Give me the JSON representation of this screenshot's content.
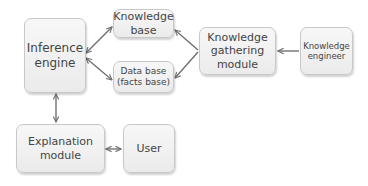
{
  "diagram": {
    "nodes": [
      {
        "id": "inference_engine",
        "label": "Inference\nengine"
      },
      {
        "id": "knowledge_base",
        "label": "Knowledge\nbase"
      },
      {
        "id": "data_base",
        "label": "Data base\n(facts base)"
      },
      {
        "id": "knowledge_gathering_module",
        "label": "Knowledge\ngathering\nmodule"
      },
      {
        "id": "knowledge_engineer",
        "label": "Knowledge\nengineer"
      },
      {
        "id": "explanation_module",
        "label": "Explanation\nmodule"
      },
      {
        "id": "user",
        "label": "User"
      }
    ],
    "edges": [
      {
        "from": "inference_engine",
        "to": "knowledge_base",
        "direction": "both"
      },
      {
        "from": "inference_engine",
        "to": "data_base",
        "direction": "both"
      },
      {
        "from": "knowledge_gathering_module",
        "to": "knowledge_base",
        "direction": "forward"
      },
      {
        "from": "knowledge_gathering_module",
        "to": "data_base",
        "direction": "forward"
      },
      {
        "from": "knowledge_engineer",
        "to": "knowledge_gathering_module",
        "direction": "forward"
      },
      {
        "from": "inference_engine",
        "to": "explanation_module",
        "direction": "both"
      },
      {
        "from": "explanation_module",
        "to": "user",
        "direction": "both"
      }
    ],
    "colors": {
      "box_fill": "#f2f2f2",
      "box_border": "#c8c8c8",
      "arrow": "#707070",
      "text": "#444444"
    }
  }
}
